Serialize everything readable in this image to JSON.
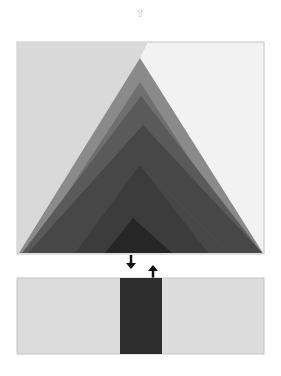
{
  "header": {
    "top_icon": "⇧"
  },
  "colors": {
    "panel_left": "#d9d9d9",
    "panel_right": "#f2f2f2",
    "panel_border": "#c4c4c4",
    "layer_1": "#8a8a8a",
    "layer_2": "#6f6f6f",
    "layer_3": "#5a5a5a",
    "layer_4": "#474747",
    "layer_5": "#3c3c3c",
    "layer_6": "#262626",
    "bar": "#2e2e2e",
    "arrow": "#111111",
    "bottom_panel": "#dcdcdc"
  },
  "diagram": {
    "top_panel": {
      "label": "layered-triangle-panel"
    },
    "arrows": [
      {
        "direction": "down"
      },
      {
        "direction": "up"
      }
    ],
    "bottom_panel": {
      "label": "bar-panel"
    }
  }
}
